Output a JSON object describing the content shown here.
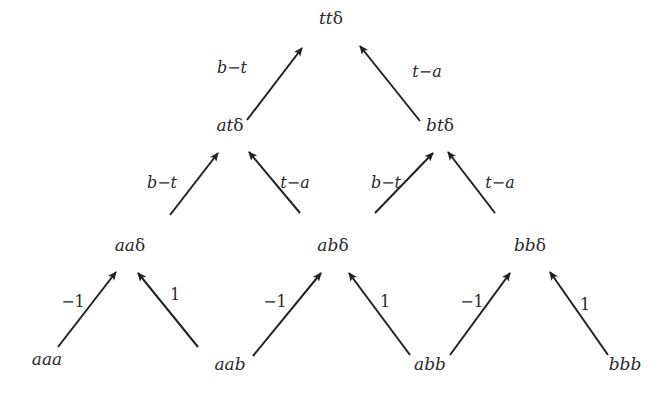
{
  "diagram": {
    "type": "tree",
    "nodes": [
      {
        "id": "tt",
        "label_main": "tt",
        "label_suffix": "δ",
        "x": 331,
        "y": 24
      },
      {
        "id": "at",
        "label_main": "at",
        "label_suffix": "δ",
        "x": 230,
        "y": 131
      },
      {
        "id": "bt",
        "label_main": "bt",
        "label_suffix": "δ",
        "x": 440,
        "y": 131
      },
      {
        "id": "aa",
        "label_main": "aa",
        "label_suffix": "δ",
        "x": 130,
        "y": 251
      },
      {
        "id": "ab",
        "label_main": "ab",
        "label_suffix": "δ",
        "x": 333,
        "y": 251
      },
      {
        "id": "bb",
        "label_main": "bb",
        "label_suffix": "δ",
        "x": 530,
        "y": 251
      },
      {
        "id": "aaa",
        "label_main": "aaa",
        "label_suffix": "",
        "x": 47,
        "y": 365
      },
      {
        "id": "aab",
        "label_main": "aab",
        "label_suffix": "",
        "x": 230,
        "y": 370
      },
      {
        "id": "abb",
        "label_main": "abb",
        "label_suffix": "",
        "x": 430,
        "y": 370
      },
      {
        "id": "bbb",
        "label_main": "bbb",
        "label_suffix": "",
        "x": 625,
        "y": 370
      }
    ],
    "edges": [
      {
        "from": "at",
        "to": "tt",
        "label": "b−t",
        "x1": 247,
        "y1": 120,
        "x2": 302,
        "y2": 48,
        "lx": 232,
        "ly": 73,
        "italic": true
      },
      {
        "from": "bt",
        "to": "tt",
        "label": "t−a",
        "x1": 420,
        "y1": 121,
        "x2": 360,
        "y2": 46,
        "lx": 427,
        "ly": 77,
        "italic": true
      },
      {
        "from": "aa",
        "to": "at",
        "label": "b−t",
        "x1": 170,
        "y1": 215,
        "x2": 218,
        "y2": 153,
        "lx": 162,
        "ly": 188,
        "italic": true
      },
      {
        "from": "ab",
        "to": "at",
        "label": "t−a",
        "x1": 300,
        "y1": 213,
        "x2": 249,
        "y2": 152,
        "lx": 295,
        "ly": 188,
        "italic": true
      },
      {
        "from": "ab",
        "to": "bt",
        "label": "b−t",
        "x1": 375,
        "y1": 213,
        "x2": 433,
        "y2": 153,
        "lx": 386,
        "ly": 188,
        "italic": true
      },
      {
        "from": "bb",
        "to": "bt",
        "label": "t−a",
        "x1": 495,
        "y1": 213,
        "x2": 448,
        "y2": 152,
        "lx": 500,
        "ly": 188,
        "italic": true
      },
      {
        "from": "aaa",
        "to": "aa",
        "label": "−1",
        "x1": 58,
        "y1": 347,
        "x2": 116,
        "y2": 272,
        "lx": 73,
        "ly": 307,
        "italic": false
      },
      {
        "from": "aab",
        "to": "aa",
        "label": "1",
        "x1": 198,
        "y1": 347,
        "x2": 138,
        "y2": 273,
        "lx": 175,
        "ly": 300,
        "italic": false
      },
      {
        "from": "aab",
        "to": "ab",
        "label": "−1",
        "x1": 253,
        "y1": 356,
        "x2": 321,
        "y2": 273,
        "lx": 275,
        "ly": 307,
        "italic": false
      },
      {
        "from": "abb",
        "to": "ab",
        "label": "1",
        "x1": 410,
        "y1": 355,
        "x2": 349,
        "y2": 273,
        "lx": 385,
        "ly": 307,
        "italic": false
      },
      {
        "from": "abb",
        "to": "bb",
        "label": "−1",
        "x1": 450,
        "y1": 355,
        "x2": 510,
        "y2": 273,
        "lx": 472,
        "ly": 307,
        "italic": false
      },
      {
        "from": "bbb",
        "to": "bb",
        "label": "1",
        "x1": 608,
        "y1": 355,
        "x2": 550,
        "y2": 272,
        "lx": 585,
        "ly": 310,
        "italic": false
      }
    ]
  }
}
